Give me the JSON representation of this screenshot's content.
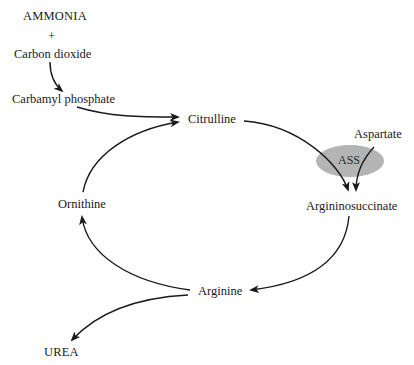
{
  "diagram": {
    "type": "metabolic-cycle",
    "nodes": {
      "ammonia": "AMMONIA",
      "plus": "+",
      "carbon_dioxide": "Carbon dioxide",
      "carbamyl_phosphate": "Carbamyl phosphate",
      "citrulline": "Citrulline",
      "aspartate": "Aspartate",
      "argininosuccinate": "Argininosuccinate",
      "arginine": "Arginine",
      "ornithine": "Ornithine",
      "urea": "UREA"
    },
    "enzyme": {
      "label": "ASS",
      "color": "#b4b4b4"
    },
    "edges": [
      {
        "from": "Carbon dioxide",
        "to": "Carbamyl phosphate"
      },
      {
        "from": "Carbamyl phosphate",
        "to": "Citrulline"
      },
      {
        "from": "Ornithine",
        "to": "Citrulline"
      },
      {
        "from": "Citrulline",
        "to": "Argininosuccinate",
        "via": "ASS"
      },
      {
        "from": "Aspartate",
        "to": "Argininosuccinate",
        "via": "ASS"
      },
      {
        "from": "Argininosuccinate",
        "to": "Arginine"
      },
      {
        "from": "Arginine",
        "to": "Ornithine"
      },
      {
        "from": "Arginine",
        "to": "UREA"
      }
    ],
    "colors": {
      "line": "#1a1a1a",
      "background": "#ffffff"
    }
  }
}
